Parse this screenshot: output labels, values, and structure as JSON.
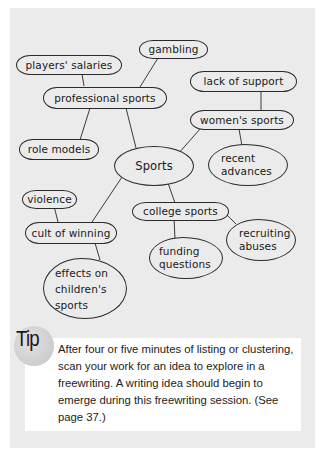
{
  "diagram": {
    "type": "cluster-map",
    "center": "Sports",
    "nodes": {
      "gambling": "gambling",
      "players_salaries": "players' salaries",
      "professional_sports": "professional sports",
      "lack_of_support": "lack of support",
      "womens_sports": "women's sports",
      "role_models": "role models",
      "sports": "Sports",
      "recent_advances": "recent advances",
      "violence": "violence",
      "college_sports": "college sports",
      "recruiting_abuses": "recruiting abuses",
      "cult_of_winning": "cult of winning",
      "funding_questions": "funding questions",
      "effects_on_childrens_sports": "effects on children's sports"
    },
    "edges": [
      [
        "sports",
        "professional_sports"
      ],
      [
        "sports",
        "womens_sports"
      ],
      [
        "sports",
        "college_sports"
      ],
      [
        "sports",
        "cult_of_winning"
      ],
      [
        "professional_sports",
        "players_salaries"
      ],
      [
        "professional_sports",
        "gambling"
      ],
      [
        "professional_sports",
        "role_models"
      ],
      [
        "womens_sports",
        "lack_of_support"
      ],
      [
        "womens_sports",
        "recent_advances"
      ],
      [
        "college_sports",
        "funding_questions"
      ],
      [
        "college_sports",
        "recruiting_abuses"
      ],
      [
        "cult_of_winning",
        "violence"
      ],
      [
        "cult_of_winning",
        "effects_on_childrens_sports"
      ]
    ]
  },
  "tip": {
    "label": "Tip",
    "text": "After four or five minutes of listing or clustering, scan your work for an idea to explore in a freewriting. A writing idea should begin to emerge during this freewriting session. (See page 37.)"
  },
  "colors": {
    "panel_bg": "#ebebeb",
    "tip_bg": "#ffffff",
    "line": "#2a2a2a"
  }
}
